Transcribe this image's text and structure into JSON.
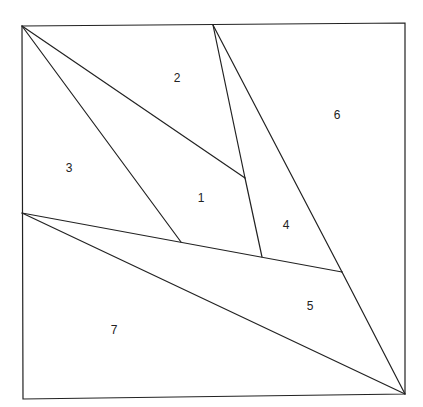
{
  "diagram": {
    "title": "",
    "stroke_color": "#222222",
    "background": "#ffffff",
    "outline": [
      [
        22,
        26
      ],
      [
        405,
        23
      ],
      [
        405,
        394
      ],
      [
        23,
        399
      ]
    ],
    "segments": [
      {
        "from": [
          22,
          26
        ],
        "to": [
          245,
          178
        ]
      },
      {
        "from": [
          22,
          26
        ],
        "to": [
          181,
          242
        ]
      },
      {
        "from": [
          213,
          25
        ],
        "to": [
          245,
          178
        ]
      },
      {
        "from": [
          245,
          178
        ],
        "to": [
          262,
          257
        ]
      },
      {
        "from": [
          213,
          25
        ],
        "to": [
          342,
          272
        ]
      },
      {
        "from": [
          342,
          272
        ],
        "to": [
          405,
          394
        ]
      },
      {
        "from": [
          22,
          213
        ],
        "to": [
          342,
          272
        ]
      },
      {
        "from": [
          22,
          213
        ],
        "to": [
          405,
          394
        ]
      }
    ],
    "regions": [
      {
        "label": "1",
        "x": 201,
        "y": 199
      },
      {
        "label": "2",
        "x": 177,
        "y": 79
      },
      {
        "label": "3",
        "x": 69,
        "y": 169
      },
      {
        "label": "4",
        "x": 286,
        "y": 226
      },
      {
        "label": "5",
        "x": 310,
        "y": 307
      },
      {
        "label": "6",
        "x": 337,
        "y": 116
      },
      {
        "label": "7",
        "x": 114,
        "y": 331
      }
    ]
  }
}
